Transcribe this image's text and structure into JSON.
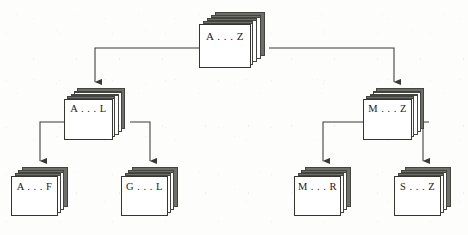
{
  "diagram": {
    "type": "tree",
    "title": "",
    "node_style": "stacked-cards",
    "colors": {
      "line": "#3a3a34",
      "card_face": "#ffffff",
      "card_edge": "#36362f",
      "card_shadow": "#6f6f6a",
      "text": "#1b1b17",
      "background": "#fdfdfc"
    },
    "nodes": [
      {
        "id": "root",
        "label": "A . . . Z",
        "level": 0
      },
      {
        "id": "al",
        "label": "A . . . L",
        "level": 1
      },
      {
        "id": "mz",
        "label": "M . . . Z",
        "level": 1
      },
      {
        "id": "af",
        "label": "A . . . F",
        "level": 2
      },
      {
        "id": "gl",
        "label": "G . . . L",
        "level": 2
      },
      {
        "id": "mr",
        "label": "M . . . R",
        "level": 2
      },
      {
        "id": "sz",
        "label": "S . . . Z",
        "level": 2
      }
    ],
    "edges": [
      {
        "from": "root",
        "to": "al",
        "arrow": "filled-triangle"
      },
      {
        "from": "root",
        "to": "mz",
        "arrow": "filled-triangle"
      },
      {
        "from": "al",
        "to": "af",
        "arrow": "filled-triangle"
      },
      {
        "from": "al",
        "to": "gl",
        "arrow": "filled-triangle"
      },
      {
        "from": "mz",
        "to": "mr",
        "arrow": "filled-triangle"
      },
      {
        "from": "mz",
        "to": "sz",
        "arrow": "filled-triangle"
      }
    ]
  }
}
